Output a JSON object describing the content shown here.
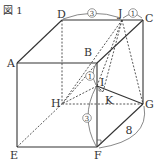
{
  "figure": {
    "title": "図 1",
    "vertices": {
      "A": "A",
      "B": "B",
      "C": "C",
      "D": "D",
      "E": "E",
      "F": "F",
      "G": "G",
      "H": "H",
      "I": "I",
      "J": "J",
      "K": "K"
    },
    "measures": {
      "DJ_ratio": "3",
      "JC_ratio": "1",
      "BI_ratio": "1",
      "IF_ratio": "3",
      "FG_length": "8"
    }
  }
}
